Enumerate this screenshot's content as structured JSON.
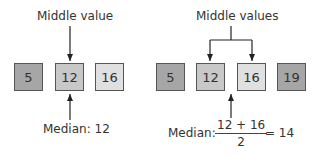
{
  "left": {
    "label": "Middle value",
    "values": [
      "5",
      "12",
      "16"
    ],
    "colors": [
      "#a6a6a6",
      "#c8c8c8",
      "#e0e0e0"
    ],
    "median_label": "Median: 12"
  },
  "right": {
    "label": "Middle values",
    "values": [
      "5",
      "12",
      "16",
      "19"
    ],
    "colors": [
      "#a6a6a6",
      "#c8c8c8",
      "#e0e0e0",
      "#a6a6a6"
    ],
    "median_prefix": "Median:",
    "numerator": "12 + 16",
    "denominator": "2",
    "result": "= 14"
  }
}
